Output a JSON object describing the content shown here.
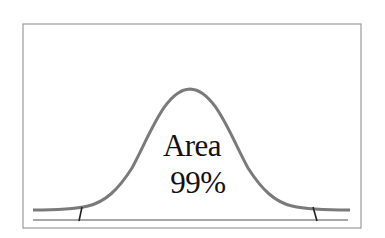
{
  "diagram": {
    "type": "normal-distribution-curve",
    "label_line1": "Area",
    "label_line2": "99%",
    "colors": {
      "frame": "#9a9a9a",
      "curve": "#7a7a7a",
      "axis": "#8a8a8a",
      "tick": "#222222",
      "text": "#111111"
    }
  }
}
